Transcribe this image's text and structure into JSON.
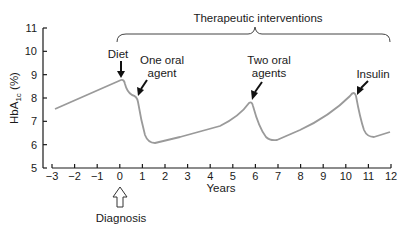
{
  "chart_data": {
    "type": "line",
    "title": "",
    "xlabel": "Years",
    "ylabel": "HbA1c (%)",
    "ylabel_main": "HbA",
    "ylabel_sub": "1c",
    "ylabel_unit": "(%)",
    "xlim": [
      -3,
      12
    ],
    "ylim": [
      5,
      11
    ],
    "grid": false,
    "x_ticks": [
      "−3",
      "−2",
      "−1",
      "0",
      "1",
      "2",
      "3",
      "4",
      "5",
      "6",
      "7",
      "8",
      "9",
      "10",
      "11",
      "12"
    ],
    "y_ticks": [
      "5",
      "6",
      "7",
      "8",
      "9",
      "10",
      "11"
    ],
    "series": [
      {
        "name": "HbA1c",
        "color": "#9a9a9a",
        "x": [
          -3,
          0,
          0.2,
          0.5,
          0.8,
          1.0,
          1.3,
          1.6,
          3.0,
          4.5,
          5.7,
          6.0,
          6.3,
          6.6,
          8.0,
          9.5,
          10.4,
          10.6,
          10.9,
          11.2,
          12.0
        ],
        "y": [
          7.5,
          8.75,
          8.1,
          8.0,
          7.7,
          6.5,
          6.1,
          6.1,
          6.4,
          6.85,
          7.75,
          6.8,
          6.2,
          6.25,
          6.8,
          7.6,
          8.25,
          7.3,
          6.4,
          6.3,
          6.5
        ]
      }
    ],
    "annotations": [
      {
        "text": "Diet",
        "x": 0,
        "y": 8.75,
        "arrow": "down"
      },
      {
        "text_lines": [
          "One oral",
          "agent"
        ],
        "x": 0.6,
        "y": 8.0,
        "arrow": "diagonal"
      },
      {
        "text_lines": [
          "Two oral",
          "agents"
        ],
        "x": 5.7,
        "y": 7.75,
        "arrow": "diagonal"
      },
      {
        "text": "Insulin",
        "x": 10.4,
        "y": 8.25,
        "arrow": "diagonal"
      },
      {
        "text": "Therapeutic interventions",
        "x_range": [
          0,
          12
        ],
        "type": "brace"
      },
      {
        "text": "Diagnosis",
        "x": 0,
        "arrow": "hollow-up"
      }
    ]
  },
  "labels": {
    "therapeutic": "Therapeutic interventions",
    "diet": "Diet",
    "one_oral_1": "One oral",
    "one_oral_2": "agent",
    "two_oral_1": "Two oral",
    "two_oral_2": "agents",
    "insulin": "Insulin",
    "diagnosis": "Diagnosis",
    "years": "Years"
  }
}
